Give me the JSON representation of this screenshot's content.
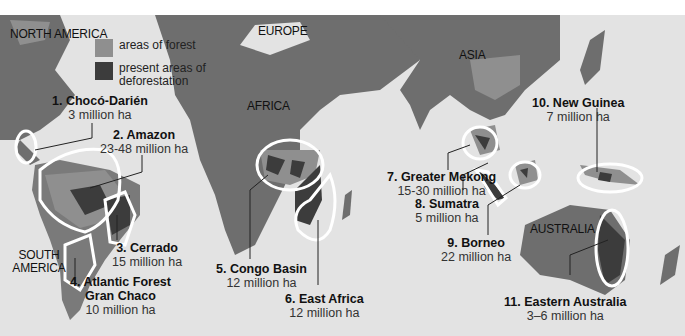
{
  "colors": {
    "ocean": "#e3e3e3",
    "land": "#6e6e6e",
    "forest": "#8f8f8f",
    "deforestation": "#3c3c3c",
    "outline": "#ffffff",
    "text": "#111111"
  },
  "legend": {
    "items": [
      {
        "label": "areas of forest",
        "color": "#8f8f8f"
      },
      {
        "label": "present areas of deforestation",
        "color": "#3c3c3c"
      }
    ]
  },
  "continents": {
    "north_america": "NORTH AMERICA",
    "europe": "EUROPE",
    "africa": "AFRICA",
    "asia": "ASIA",
    "south_america": "SOUTH AMERICA",
    "australia": "AUSTRALIA"
  },
  "regions": [
    {
      "name": "1. Chocó-Darién",
      "area": "3 million ha"
    },
    {
      "name": "2. Amazon",
      "area": "23-48 million ha"
    },
    {
      "name": "3. Cerrado",
      "area": "15 million ha"
    },
    {
      "name": "4. Atlantic Forest Gran Chaco",
      "name_line1": "4. Atlantic Forest",
      "name_line2": "Gran Chaco",
      "area": "10 million ha"
    },
    {
      "name": "5. Congo Basin",
      "area": "12 million ha"
    },
    {
      "name": "6. East Africa",
      "area": "12 million ha"
    },
    {
      "name": "7. Greater Mekong",
      "area": "15-30 million ha"
    },
    {
      "name": "8. Sumatra",
      "area": "5 million ha"
    },
    {
      "name": "9. Borneo",
      "area": "22 million ha"
    },
    {
      "name": "10. New Guinea",
      "area": "7 million ha"
    },
    {
      "name": "11. Eastern Australia",
      "area": "3–6 million ha"
    }
  ]
}
